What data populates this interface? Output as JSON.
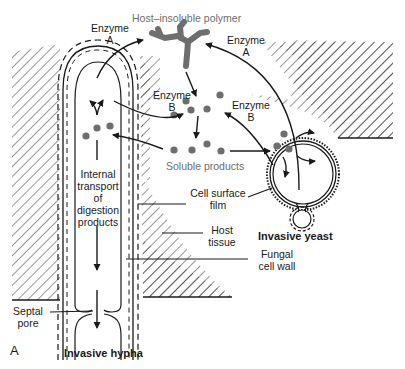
{
  "figure": {
    "panel_letter": "A",
    "colors": {
      "line": "#1a1a1a",
      "particle": "#6e6e6e",
      "gray_label": "#6e6e6e",
      "background": "#ffffff"
    }
  },
  "labels": {
    "polymer": "Host–insoluble polymer",
    "enzyme_a_hypha": [
      "Enzyme",
      "A"
    ],
    "enzyme_a_yeast": [
      "Enzyme",
      "A"
    ],
    "enzyme_b_hypha": [
      "Enzyme",
      "B"
    ],
    "enzyme_b_yeast": [
      "Enzyme",
      "B"
    ],
    "soluble_products": "Soluble products",
    "internal_transport": [
      "Internal",
      "transport",
      "of",
      "digestion",
      "products"
    ],
    "cell_surface_film": [
      "Cell surface",
      "film"
    ],
    "host_tissue": [
      "Host",
      "tissue"
    ],
    "fungal_cell_wall": [
      "Fungal",
      "cell wall"
    ],
    "septal_pore": [
      "Septal",
      "pore"
    ],
    "invasive_yeast": "Invasive yeast",
    "invasive_hypha": "Invasive hypha"
  }
}
